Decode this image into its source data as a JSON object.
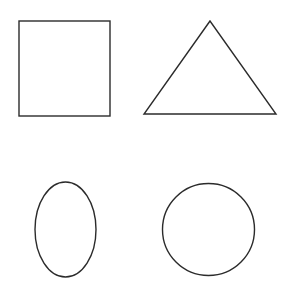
{
  "canvas": {
    "width": 297,
    "height": 289,
    "background": "#ffffff"
  },
  "stroke_color": "#2b2b2b",
  "shapes": [
    {
      "id": "square",
      "type": "rect",
      "x": 19,
      "y": 21,
      "width": 91,
      "height": 95
    },
    {
      "id": "triangle",
      "type": "polygon",
      "points": "210,21 144,114 276,114"
    },
    {
      "id": "ellipse",
      "type": "ellipse",
      "cx": 65.5,
      "cy": 229.5,
      "rx": 30.5,
      "ry": 47.5
    },
    {
      "id": "circle",
      "type": "circle",
      "cx": 208.5,
      "cy": 229.5,
      "r": 46
    }
  ]
}
